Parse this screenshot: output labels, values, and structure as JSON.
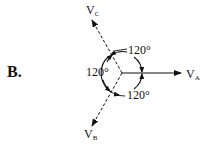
{
  "figure": {
    "part_label": "B.",
    "center": {
      "x": 122,
      "y": 73
    },
    "phasors": [
      {
        "id": "VA",
        "name": "V",
        "subscript": "A",
        "angle_deg": 0,
        "style": "solid"
      },
      {
        "id": "VB",
        "name": "V",
        "subscript": "B",
        "angle_deg": -120,
        "style": "dashed"
      },
      {
        "id": "VC",
        "name": "V",
        "subscript": "C",
        "angle_deg": 120,
        "style": "dashed"
      }
    ],
    "angles": [
      {
        "id": "a_top",
        "label": "120°"
      },
      {
        "id": "a_left",
        "label": "120°"
      },
      {
        "id": "a_bottom",
        "label": "120°"
      }
    ],
    "colors": {
      "ink": "#111111",
      "background": "#ffffff"
    }
  }
}
